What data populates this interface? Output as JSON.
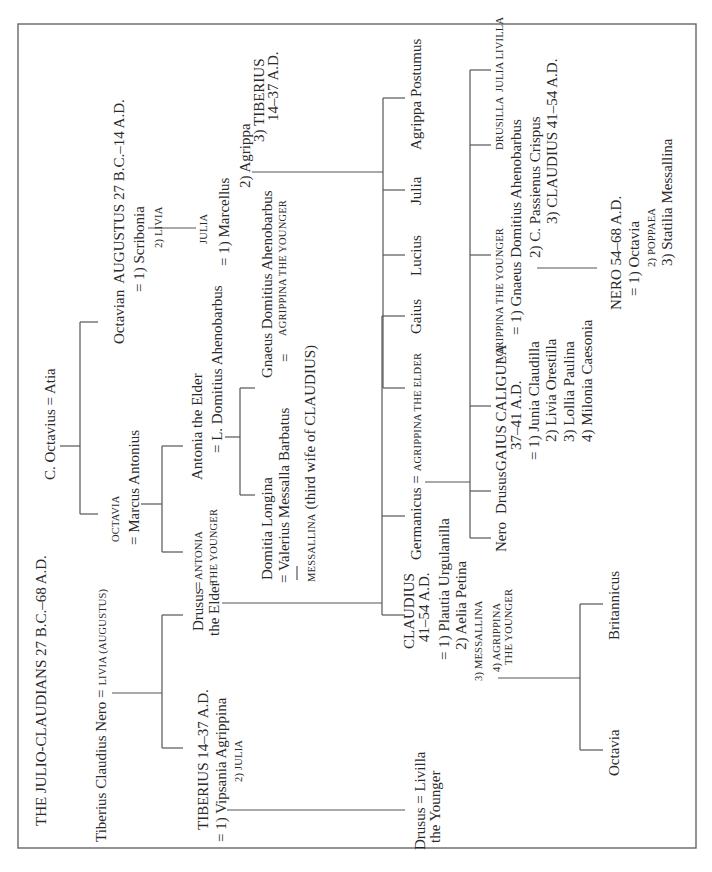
{
  "title": "THE JULIO-CLAUDIANS 27 B.C.–68 A.D.",
  "orientation": "rotated 90° counter-clockwise",
  "people": {
    "tiberius_claudius_nero": "Tiberius Claudius Nero =",
    "livia_augustus": "LIVIA (AUGUSTUS)",
    "c_octavius_atia": "C. Octavius = Atia",
    "octavian": "Octavian",
    "augustus": "AUGUSTUS 27 B.C.–14 A.D.",
    "scribonia": "= 1) Scribonia",
    "livia2": "2) LIVIA",
    "julia_label": "JULIA",
    "julia_m1": "= 1) Marcellus",
    "julia_m2": "2) Agrippa",
    "julia_m3a": "3) TIBERIUS",
    "julia_m3b": "14–37 A.D.",
    "octavia": "OCTAVIA",
    "marcus_antonius": "= Marcus Antonius",
    "antonia_younger_1": "ANTONIA",
    "antonia_younger_2": "THE YOUNGER",
    "antonia_elder": "Antonia the Elder",
    "l_domitius": "= L. Domitius Ahenobarbus",
    "domitia_longina": "Domitia Longina",
    "valerius_messalla": "= Valerius Messalla Barbatus",
    "messallina_note_sc": "MESSALLINA",
    "messallina_note": "(third wife of CLAUDIUS)",
    "gnaeus_domitius": "Gnaeus Domitius Ahenobarbus",
    "gnaeus_eq": "=",
    "agrippina_younger_sc": "AGRIPPINA THE YOUNGER",
    "tiberius_line1": "TIBERIUS 14–37 A.D.",
    "tiberius_m1": "= 1) Vipsania Agrippina",
    "tiberius_m2": "2) JULIA",
    "drusus_elder_1": "Drusus",
    "drusus_elder_2": "the Elder",
    "drusus_eq": "=",
    "drusus_younger_1": "Drusus = Livilla",
    "drusus_younger_2": "the Younger",
    "livilla": "Livilla",
    "claudius_1": "CLAUDIUS",
    "claudius_2": "41–54 A.D.",
    "claudius_m1": "= 1) Plautia Urgulanilla",
    "claudius_m2": "2) Aelia Petina",
    "claudius_m3": "3) MESSALLINA",
    "claudius_m4a": "4) AGRIPPINA",
    "claudius_m4b": "THE YOUNGER",
    "octavia_child": "Octavia",
    "britannicus": "Britannicus",
    "germanicus": "Germanicus =",
    "agrippina_elder": "AGRIPPINA THE ELDER",
    "gaius": "Gaius",
    "lucius": "Lucius",
    "julia_child": "Julia",
    "agrippa_postumus": "Agrippa Postumus",
    "nero_son": "Nero",
    "drusus_son": "Drusus",
    "caligula_1": "GAIUS CALIGULA",
    "caligula_2": "37–41 A.D.",
    "caligula_m1": "= 1) Junia Claudilla",
    "caligula_m2": "2) Livia Orestilla",
    "caligula_m3": "3) Lollia Paulina",
    "caligula_m4": "4) Milonia Caesonia",
    "agrippina_y_sc": "AGRIPPINA THE YOUNGER",
    "agrippina_m1": "= 1) Gnaeus Domitius Ahenobarbus",
    "agrippina_m2": "2) C. Passienus Crispus",
    "agrippina_m3": "3) CLAUDIUS 41–54 A.D.",
    "drusilla": "DRUSILLA",
    "julia_livilla": "JULIA LIVILLA",
    "nero_emperor": "NERO 54–68 A.D.",
    "nero_m1": "= 1) Octavia",
    "nero_m2": "2) POPPAEA",
    "nero_m3": "3) Statilia Messallina"
  },
  "colors": {
    "text": "#2a2a2a",
    "lines": "#555555",
    "background": "#ffffff"
  }
}
